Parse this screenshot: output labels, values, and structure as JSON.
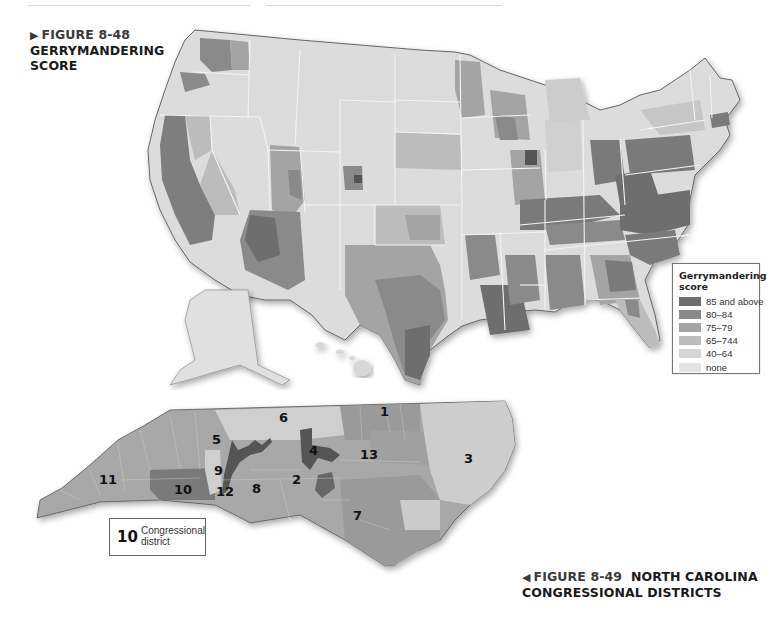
{
  "figure_48": {
    "marker": "▶",
    "number": "FIGURE 8-48",
    "title_line1": "GERRYMANDERING",
    "title_line2": "SCORE"
  },
  "figure_49": {
    "marker": "◀",
    "number": "FIGURE 8-49",
    "title_line1": "NORTH CAROLINA",
    "title_line2": "CONGRESSIONAL DISTRICTS"
  },
  "legend": {
    "title": "Gerrymandering score",
    "items": [
      {
        "label": "85 and above",
        "color": "#6e6e6e"
      },
      {
        "label": "80–84",
        "color": "#8a8a8a"
      },
      {
        "label": "75–79",
        "color": "#a4a4a4"
      },
      {
        "label": "65–744",
        "color": "#bcbcbc"
      },
      {
        "label": "40–64",
        "color": "#d6d6d6"
      },
      {
        "label": "none",
        "color": "#e4e4e4"
      }
    ]
  },
  "nc_key": {
    "number": "10",
    "text_line1": "Congressional",
    "text_line2": "district"
  },
  "nc_districts": [
    {
      "label": "1",
      "x": 380,
      "y": 412
    },
    {
      "label": "2",
      "x": 294,
      "y": 474
    },
    {
      "label": "3",
      "x": 464,
      "y": 452
    },
    {
      "label": "4",
      "x": 311,
      "y": 443
    },
    {
      "label": "5",
      "x": 214,
      "y": 432
    },
    {
      "label": "6",
      "x": 280,
      "y": 411
    },
    {
      "label": "7",
      "x": 354,
      "y": 510
    },
    {
      "label": "8",
      "x": 253,
      "y": 481
    },
    {
      "label": "9",
      "x": 216,
      "y": 463
    },
    {
      "label": "10",
      "x": 176,
      "y": 482
    },
    {
      "label": "11",
      "x": 99,
      "y": 472
    },
    {
      "label": "12",
      "x": 217,
      "y": 485
    },
    {
      "label": "13",
      "x": 362,
      "y": 448
    }
  ],
  "colors": {
    "background": "#ffffff",
    "state_border": "#f5f5f5",
    "outline": "#555555"
  }
}
